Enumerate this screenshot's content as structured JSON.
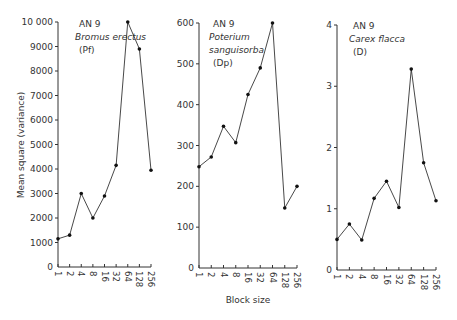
{
  "chart_data": {
    "type": "line",
    "ylabel": "Mean square (variance)",
    "xlabel": "Block size",
    "categories": [
      "1",
      "2",
      "4",
      "8",
      "16",
      "32",
      "64",
      "128",
      "256"
    ],
    "panels": [
      {
        "annotation": [
          "AN 9",
          "Bromus erectus",
          "(Pf)"
        ],
        "italic_lines": [
          1
        ],
        "ylim": [
          0,
          10000
        ],
        "yticks": [
          0,
          1000,
          2000,
          3000,
          4000,
          5000,
          6000,
          7000,
          8000,
          9000,
          10000
        ],
        "ytick_labels": [
          "0",
          "1000",
          "2000",
          "3000",
          "4000",
          "5000",
          "6000",
          "7000",
          "8000",
          "9000",
          "10 000"
        ],
        "values": [
          1150,
          1300,
          3000,
          2000,
          2900,
          4150,
          10000,
          8900,
          3950
        ]
      },
      {
        "annotation": [
          "AN 9",
          "Poterium",
          "sanguisorba",
          "(Dp)"
        ],
        "italic_lines": [
          1,
          2
        ],
        "ylim": [
          0,
          600
        ],
        "yticks": [
          0,
          100,
          200,
          300,
          400,
          500,
          600
        ],
        "ytick_labels": [
          "0",
          "100",
          "200",
          "300",
          "400",
          "500",
          "600"
        ],
        "values": [
          248,
          272,
          347,
          307,
          425,
          490,
          600,
          147,
          200
        ]
      },
      {
        "annotation": [
          "AN 9",
          "Carex flacca",
          "(D)"
        ],
        "italic_lines": [
          1
        ],
        "ylim": [
          0,
          4
        ],
        "yticks": [
          0,
          1,
          2,
          3,
          4
        ],
        "ytick_labels": [
          "0",
          "1",
          "2",
          "3",
          "4"
        ],
        "values": [
          0.5,
          0.75,
          0.49,
          1.17,
          1.45,
          1.02,
          3.28,
          1.75,
          1.13
        ]
      }
    ]
  }
}
